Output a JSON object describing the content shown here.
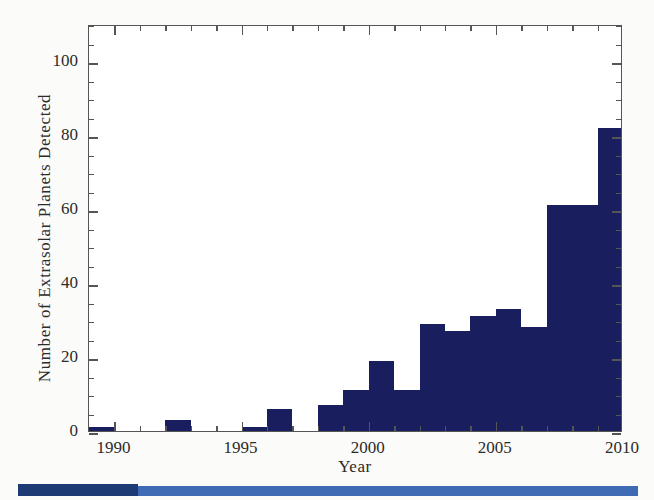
{
  "chart_data": {
    "type": "bar",
    "title": "",
    "xlabel": "Year",
    "ylabel": "Number of Extrasolar Planets Detected",
    "xlim": [
      1989,
      2010
    ],
    "ylim": [
      0,
      110
    ],
    "grid": false,
    "legend": null,
    "bar_color": "#191f5e",
    "x_major_ticks": [
      1990,
      1995,
      2000,
      2005,
      2010
    ],
    "x_major_tick_labels": [
      "1990",
      "1995",
      "2000",
      "2005",
      "2010"
    ],
    "x_minor_tick_step": 1,
    "y_major_ticks": [
      0,
      20,
      40,
      60,
      80,
      100
    ],
    "y_major_tick_labels": [
      "0",
      "20",
      "40",
      "60",
      "80",
      "100"
    ],
    "y_minor_tick_step": 5,
    "categories": [
      1989,
      1990,
      1991,
      1992,
      1993,
      1994,
      1995,
      1996,
      1997,
      1998,
      1999,
      2000,
      2001,
      2002,
      2003,
      2004,
      2005,
      2006,
      2007,
      2008,
      2009
    ],
    "values": [
      1,
      0,
      0,
      3,
      0,
      0,
      1,
      6,
      0,
      7,
      11,
      19,
      11,
      29,
      27,
      31,
      33,
      28,
      61,
      61,
      82
    ],
    "partial_final_bin": {
      "year": 2010,
      "value": 107,
      "note": "tallest bar at right edge"
    }
  },
  "axes": {
    "x_title": "Year",
    "y_title": "Number of Extrasolar Planets Detected"
  },
  "decoration": {
    "scan_band_dark_color": "#1d3a75",
    "scan_band_light_color": "#3f6bb5"
  }
}
